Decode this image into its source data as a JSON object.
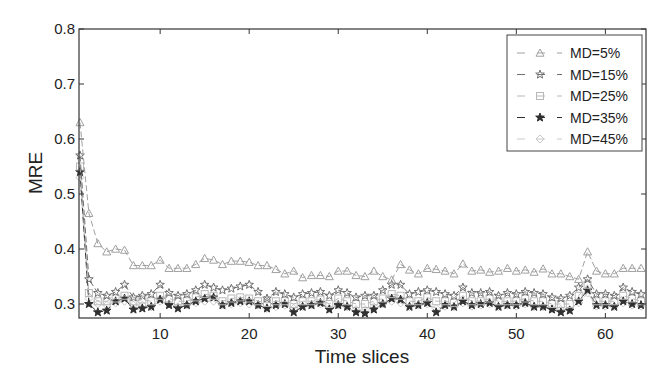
{
  "chart_data": {
    "type": "line",
    "title": "",
    "xlabel": "Time slices",
    "ylabel": "MRE",
    "xlim": [
      1,
      64
    ],
    "ylim": [
      0.275,
      0.8
    ],
    "xticks": [
      10,
      20,
      30,
      40,
      50,
      60
    ],
    "yticks": [
      0.3,
      0.4,
      0.5,
      0.6,
      0.7,
      0.8
    ],
    "ytick_labels": [
      "0.3",
      "0.4",
      "0.5",
      "0.6",
      "0.7",
      "0.8"
    ],
    "grid": false,
    "legend_position": "upper right",
    "x": [
      1,
      2,
      3,
      4,
      5,
      6,
      7,
      8,
      9,
      10,
      11,
      12,
      13,
      14,
      15,
      16,
      17,
      18,
      19,
      20,
      21,
      22,
      23,
      24,
      25,
      26,
      27,
      28,
      29,
      30,
      31,
      32,
      33,
      34,
      35,
      36,
      37,
      38,
      39,
      40,
      41,
      42,
      43,
      44,
      45,
      46,
      47,
      48,
      49,
      50,
      51,
      52,
      53,
      54,
      55,
      56,
      57,
      58,
      59,
      60,
      61,
      62,
      63,
      64
    ],
    "series": [
      {
        "name": "MD=5%",
        "marker": "triangle",
        "color": "#a0a0a0",
        "values": [
          0.63,
          0.465,
          0.41,
          0.395,
          0.4,
          0.398,
          0.37,
          0.37,
          0.37,
          0.38,
          0.365,
          0.365,
          0.365,
          0.372,
          0.383,
          0.38,
          0.372,
          0.378,
          0.378,
          0.376,
          0.37,
          0.37,
          0.363,
          0.355,
          0.36,
          0.348,
          0.352,
          0.352,
          0.35,
          0.36,
          0.36,
          0.352,
          0.35,
          0.36,
          0.35,
          0.344,
          0.372,
          0.362,
          0.355,
          0.365,
          0.363,
          0.36,
          0.355,
          0.373,
          0.36,
          0.362,
          0.358,
          0.36,
          0.365,
          0.36,
          0.362,
          0.358,
          0.364,
          0.355,
          0.355,
          0.35,
          0.345,
          0.395,
          0.36,
          0.355,
          0.355,
          0.365,
          0.365,
          0.365
        ]
      },
      {
        "name": "MD=15%",
        "marker": "star-open",
        "color": "#707070",
        "values": [
          0.57,
          0.345,
          0.32,
          0.315,
          0.322,
          0.335,
          0.312,
          0.315,
          0.318,
          0.335,
          0.32,
          0.315,
          0.318,
          0.325,
          0.335,
          0.33,
          0.325,
          0.328,
          0.332,
          0.335,
          0.322,
          0.31,
          0.322,
          0.318,
          0.312,
          0.318,
          0.32,
          0.322,
          0.315,
          0.325,
          0.32,
          0.312,
          0.315,
          0.315,
          0.325,
          0.335,
          0.335,
          0.318,
          0.322,
          0.325,
          0.322,
          0.318,
          0.315,
          0.33,
          0.32,
          0.32,
          0.322,
          0.315,
          0.32,
          0.318,
          0.322,
          0.32,
          0.318,
          0.312,
          0.31,
          0.315,
          0.33,
          0.345,
          0.318,
          0.318,
          0.315,
          0.33,
          0.322,
          0.318
        ]
      },
      {
        "name": "MD=25%",
        "marker": "square",
        "color": "#b8b8b8",
        "values": [
          0.55,
          0.32,
          0.305,
          0.305,
          0.31,
          0.315,
          0.305,
          0.308,
          0.305,
          0.315,
          0.31,
          0.305,
          0.305,
          0.312,
          0.318,
          0.315,
          0.305,
          0.31,
          0.312,
          0.31,
          0.305,
          0.302,
          0.305,
          0.305,
          0.3,
          0.305,
          0.305,
          0.308,
          0.3,
          0.31,
          0.305,
          0.3,
          0.3,
          0.305,
          0.31,
          0.318,
          0.315,
          0.305,
          0.305,
          0.312,
          0.305,
          0.305,
          0.302,
          0.315,
          0.305,
          0.305,
          0.31,
          0.305,
          0.305,
          0.305,
          0.31,
          0.305,
          0.305,
          0.3,
          0.3,
          0.3,
          0.315,
          0.335,
          0.305,
          0.305,
          0.305,
          0.315,
          0.31,
          0.305
        ]
      },
      {
        "name": "MD=35%",
        "marker": "star-filled",
        "color": "#303030",
        "values": [
          0.54,
          0.3,
          0.285,
          0.288,
          0.305,
          0.31,
          0.29,
          0.292,
          0.295,
          0.308,
          0.298,
          0.292,
          0.298,
          0.305,
          0.31,
          0.312,
          0.298,
          0.302,
          0.305,
          0.305,
          0.298,
          0.292,
          0.298,
          0.3,
          0.285,
          0.295,
          0.298,
          0.302,
          0.29,
          0.298,
          0.295,
          0.285,
          0.283,
          0.29,
          0.3,
          0.31,
          0.308,
          0.295,
          0.298,
          0.302,
          0.285,
          0.298,
          0.295,
          0.305,
          0.298,
          0.3,
          0.302,
          0.295,
          0.298,
          0.298,
          0.302,
          0.295,
          0.295,
          0.29,
          0.285,
          0.288,
          0.305,
          0.325,
          0.298,
          0.298,
          0.295,
          0.305,
          0.3,
          0.298
        ]
      },
      {
        "name": "MD=45%",
        "marker": "diamond",
        "color": "#c8c8c8",
        "values": [
          0.53,
          0.31,
          0.3,
          0.298,
          0.302,
          0.305,
          0.298,
          0.298,
          0.295,
          0.305,
          0.3,
          0.295,
          0.298,
          0.302,
          0.305,
          0.305,
          0.298,
          0.3,
          0.302,
          0.3,
          0.298,
          0.292,
          0.295,
          0.298,
          0.292,
          0.295,
          0.298,
          0.3,
          0.292,
          0.298,
          0.295,
          0.29,
          0.29,
          0.295,
          0.3,
          0.305,
          0.302,
          0.295,
          0.298,
          0.3,
          0.292,
          0.296,
          0.295,
          0.302,
          0.296,
          0.298,
          0.3,
          0.295,
          0.298,
          0.296,
          0.3,
          0.295,
          0.295,
          0.292,
          0.29,
          0.29,
          0.302,
          0.32,
          0.296,
          0.296,
          0.295,
          0.302,
          0.298,
          0.296
        ]
      }
    ]
  },
  "legend": {
    "items": [
      "MD=5%",
      "MD=15%",
      "MD=25%",
      "MD=35%",
      "MD=45%"
    ]
  },
  "axes": {
    "xlabel": "Time slices",
    "ylabel": "MRE",
    "xtick_labels": [
      "10",
      "20",
      "30",
      "40",
      "50",
      "60"
    ],
    "ytick_labels": [
      "0.3",
      "0.4",
      "0.5",
      "0.6",
      "0.7",
      "0.8"
    ]
  }
}
